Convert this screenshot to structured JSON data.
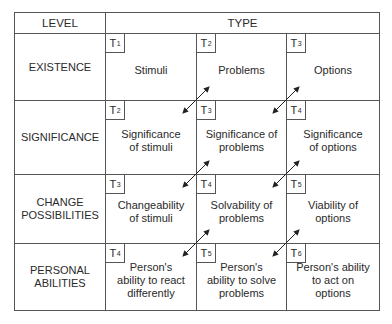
{
  "header": {
    "level_label": "LEVEL",
    "type_label": "TYPE"
  },
  "rows": [
    {
      "level": "EXISTENCE",
      "cells": [
        {
          "tag": "T",
          "sub": "1",
          "text": "Stimuli"
        },
        {
          "tag": "T",
          "sub": "2",
          "text": "Problems"
        },
        {
          "tag": "T",
          "sub": "3",
          "text": "Options"
        }
      ]
    },
    {
      "level": "SIGNIFICANCE",
      "cells": [
        {
          "tag": "T",
          "sub": "2",
          "text": "Significance of stimuli"
        },
        {
          "tag": "T",
          "sub": "3",
          "text": "Significance of problems"
        },
        {
          "tag": "T",
          "sub": "4",
          "text": "Significance of options"
        }
      ]
    },
    {
      "level": "CHANGE POSSIBILITIES",
      "cells": [
        {
          "tag": "T",
          "sub": "3",
          "text": "Changeability of stimuli"
        },
        {
          "tag": "T",
          "sub": "4",
          "text": "Solvability of problems"
        },
        {
          "tag": "T",
          "sub": "5",
          "text": "Viability of options"
        }
      ]
    },
    {
      "level": "PERSONAL ABILITIES",
      "cells": [
        {
          "tag": "T",
          "sub": "4",
          "text": "Person's ability to react differently"
        },
        {
          "tag": "T",
          "sub": "5",
          "text": "Person's ability to solve problems"
        },
        {
          "tag": "T",
          "sub": "6",
          "text": "Person's ability to act on options"
        }
      ]
    }
  ],
  "arrows": [
    {
      "x": 196,
      "y": 100
    },
    {
      "x": 286,
      "y": 100
    },
    {
      "x": 196,
      "y": 174
    },
    {
      "x": 286,
      "y": 174
    },
    {
      "x": 196,
      "y": 243
    },
    {
      "x": 286,
      "y": 243
    }
  ],
  "colors": {
    "line": "#555555",
    "text": "#2a2a2a",
    "arrow": "#222222"
  }
}
